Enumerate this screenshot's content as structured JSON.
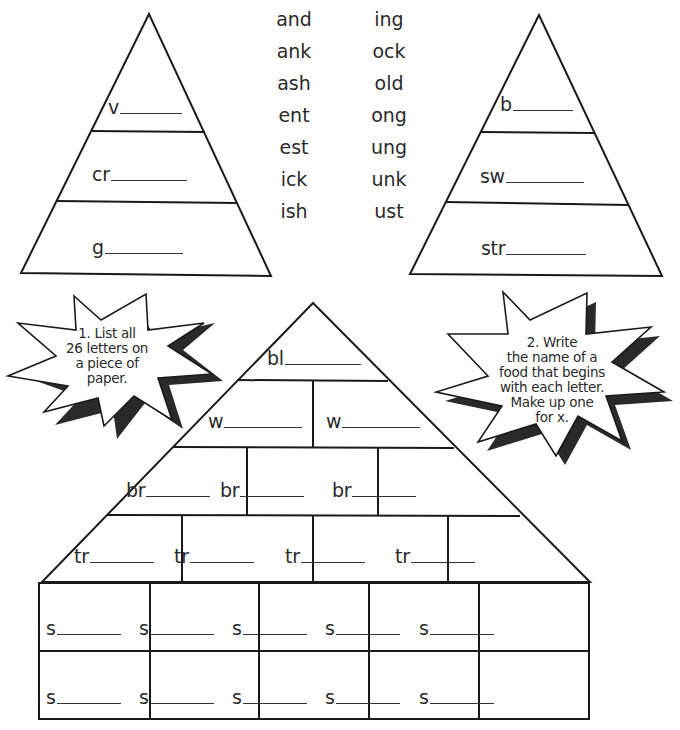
{
  "word_endings": {
    "left_column": [
      "and",
      "ank",
      "ash",
      "ent",
      "est",
      "ick",
      "ish"
    ],
    "right_column": [
      "ing",
      "ock",
      "old",
      "ong",
      "ung",
      "unk",
      "ust"
    ]
  },
  "left_triangle": {
    "rows": [
      {
        "stem": "v"
      },
      {
        "stem": "cr"
      },
      {
        "stem": "g"
      }
    ]
  },
  "right_triangle": {
    "rows": [
      {
        "stem": "b"
      },
      {
        "stem": "sw"
      },
      {
        "stem": "str"
      }
    ]
  },
  "instructions": {
    "step1": {
      "lines": [
        "1. List all",
        "26 letters on",
        "a piece of",
        "paper."
      ]
    },
    "step2": {
      "lines": [
        "2. Write",
        "the name of a",
        "food that begins",
        "with each letter.",
        "Make up one",
        "for x."
      ]
    }
  },
  "pyramid": {
    "row1": [
      {
        "stem": "bl"
      }
    ],
    "row2": [
      {
        "stem": "w"
      },
      {
        "stem": "w"
      }
    ],
    "row3": [
      {
        "stem": "br"
      },
      {
        "stem": "br"
      },
      {
        "stem": "br"
      }
    ],
    "row4": [
      {
        "stem": "tr"
      },
      {
        "stem": "tr"
      },
      {
        "stem": "tr"
      },
      {
        "stem": "tr"
      }
    ],
    "row5": [
      {
        "stem": "s"
      },
      {
        "stem": "s"
      },
      {
        "stem": "s"
      },
      {
        "stem": "s"
      },
      {
        "stem": "s"
      }
    ],
    "row6": [
      {
        "stem": "s"
      },
      {
        "stem": "s"
      },
      {
        "stem": "s"
      },
      {
        "stem": "s"
      },
      {
        "stem": "s"
      }
    ]
  }
}
